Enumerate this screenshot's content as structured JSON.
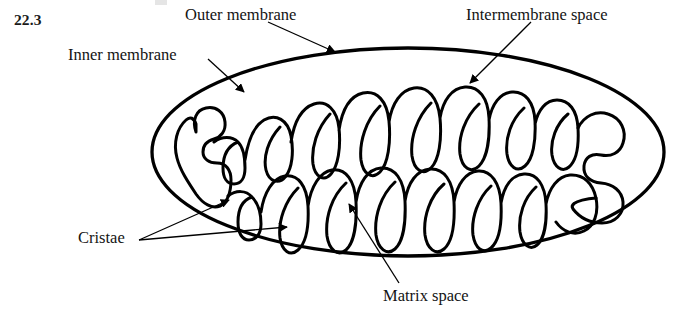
{
  "figure": {
    "number": "22.3",
    "background_color": "#ffffff",
    "line_color": "#000000"
  },
  "labels": {
    "outer_membrane": "Outer membrane",
    "intermembrane_space": "Intermembrane space",
    "inner_membrane": "Inner membrane",
    "cristae": "Cristae",
    "matrix_space": "Matrix space"
  },
  "diagram": {
    "outer_membrane": {
      "shape": "ellipse",
      "cx": 408,
      "cy": 152,
      "rx": 256,
      "ry": 104,
      "stroke_width": 3.2
    },
    "inner_membrane": {
      "shape": "serpentine-folded-closed-curve",
      "stroke_width": 3.0,
      "description": "continuous convoluted membrane forming finger-like cristae projecting inward from top and bottom"
    },
    "leader_lines": [
      {
        "name": "outer-membrane-leader",
        "from": [
          268,
          22
        ],
        "to": [
          337,
          53
        ]
      },
      {
        "name": "intermembrane-space-leader",
        "from": [
          530,
          22
        ],
        "to": [
          468,
          82
        ]
      },
      {
        "name": "inner-membrane-leader",
        "from": [
          209,
          60
        ],
        "to": [
          245,
          92
        ]
      },
      {
        "name": "cristae-leader-upper",
        "from": [
          140,
          240
        ],
        "to": [
          228,
          200
        ]
      },
      {
        "name": "cristae-leader-lower",
        "from": [
          140,
          240
        ],
        "to": [
          285,
          228
        ]
      },
      {
        "name": "matrix-space-leader",
        "from": [
          398,
          284
        ],
        "to": [
          350,
          205
        ]
      }
    ]
  }
}
